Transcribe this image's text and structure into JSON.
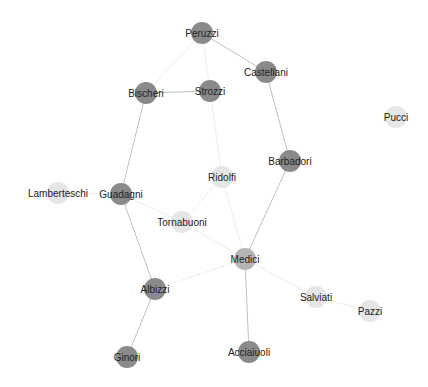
{
  "graph": {
    "title": "Florentine families network",
    "colors": {
      "background": "#ffffff",
      "node_dark": "#8a8a8a",
      "node_mid": "#b5b5b5",
      "node_light": "#e6e6e6",
      "edge_strong": "#c0c0c0",
      "edge_faint": "#eeeeee",
      "label": "#222222"
    },
    "nodes": [
      {
        "id": "Peruzzi",
        "label": "Peruzzi",
        "x": 202,
        "y": 33,
        "r": 11,
        "shade": "node_dark"
      },
      {
        "id": "Castellani",
        "label": "Castellani",
        "x": 266,
        "y": 72,
        "r": 11,
        "shade": "node_dark"
      },
      {
        "id": "Bischeri",
        "label": "Bischeri",
        "x": 146,
        "y": 93,
        "r": 11,
        "shade": "node_dark"
      },
      {
        "id": "Strozzi",
        "label": "Strozzi",
        "x": 210,
        "y": 91,
        "r": 11,
        "shade": "node_dark"
      },
      {
        "id": "Pucci",
        "label": "Pucci",
        "x": 396,
        "y": 117,
        "r": 11,
        "shade": "node_light"
      },
      {
        "id": "Ridolfi",
        "label": "Ridolfi",
        "x": 222,
        "y": 177,
        "r": 11,
        "shade": "node_light"
      },
      {
        "id": "Barbadori",
        "label": "Barbadori",
        "x": 290,
        "y": 161,
        "r": 11,
        "shade": "node_dark"
      },
      {
        "id": "Lamberteschi",
        "label": "Lamberteschi",
        "x": 58,
        "y": 193,
        "r": 11,
        "shade": "node_light"
      },
      {
        "id": "Guadagni",
        "label": "Guadagni",
        "x": 121,
        "y": 194,
        "r": 11,
        "shade": "node_dark"
      },
      {
        "id": "Tornabuoni",
        "label": "Tornabuoni",
        "x": 182,
        "y": 222,
        "r": 11,
        "shade": "node_light"
      },
      {
        "id": "Medici",
        "label": "Medici",
        "x": 245,
        "y": 259,
        "r": 11,
        "shade": "node_mid"
      },
      {
        "id": "Albizzi",
        "label": "Albizzi",
        "x": 155,
        "y": 289,
        "r": 11,
        "shade": "node_dark"
      },
      {
        "id": "Salviati",
        "label": "Salviati",
        "x": 316,
        "y": 297,
        "r": 11,
        "shade": "node_light"
      },
      {
        "id": "Pazzi",
        "label": "Pazzi",
        "x": 370,
        "y": 311,
        "r": 11,
        "shade": "node_light"
      },
      {
        "id": "Ginori",
        "label": "Ginori",
        "x": 127,
        "y": 357,
        "r": 11,
        "shade": "node_dark"
      },
      {
        "id": "Acciaiuoli",
        "label": "Acciaiuoli",
        "x": 249,
        "y": 352,
        "r": 11,
        "shade": "node_dark"
      }
    ],
    "edges": [
      {
        "source": "Peruzzi",
        "target": "Castellani",
        "strength": "strong"
      },
      {
        "source": "Peruzzi",
        "target": "Bischeri",
        "strength": "faint"
      },
      {
        "source": "Peruzzi",
        "target": "Strozzi",
        "strength": "faint"
      },
      {
        "source": "Bischeri",
        "target": "Strozzi",
        "strength": "strong"
      },
      {
        "source": "Castellani",
        "target": "Barbadori",
        "strength": "strong"
      },
      {
        "source": "Bischeri",
        "target": "Guadagni",
        "strength": "strong"
      },
      {
        "source": "Strozzi",
        "target": "Ridolfi",
        "strength": "faint"
      },
      {
        "source": "Ridolfi",
        "target": "Tornabuoni",
        "strength": "faint"
      },
      {
        "source": "Ridolfi",
        "target": "Medici",
        "strength": "faint"
      },
      {
        "source": "Barbadori",
        "target": "Medici",
        "strength": "strong"
      },
      {
        "source": "Guadagni",
        "target": "Lamberteschi",
        "strength": "faint"
      },
      {
        "source": "Guadagni",
        "target": "Tornabuoni",
        "strength": "faint"
      },
      {
        "source": "Guadagni",
        "target": "Albizzi",
        "strength": "strong"
      },
      {
        "source": "Tornabuoni",
        "target": "Medici",
        "strength": "faint"
      },
      {
        "source": "Albizzi",
        "target": "Medici",
        "strength": "faint"
      },
      {
        "source": "Albizzi",
        "target": "Ginori",
        "strength": "strong"
      },
      {
        "source": "Medici",
        "target": "Acciaiuoli",
        "strength": "strong"
      },
      {
        "source": "Medici",
        "target": "Salviati",
        "strength": "faint"
      },
      {
        "source": "Salviati",
        "target": "Pazzi",
        "strength": "faint"
      }
    ]
  }
}
